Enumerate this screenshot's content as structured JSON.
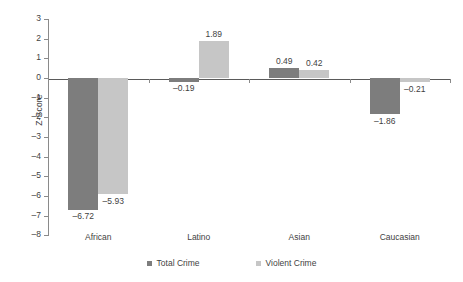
{
  "chart_data": {
    "type": "bar",
    "title": "",
    "xlabel": "",
    "ylabel": "Z-Score",
    "ylim": [
      -8,
      3
    ],
    "ytick_labels": [
      "3",
      "2",
      "1",
      "0",
      "–1",
      "–2",
      "–3",
      "–4",
      "–5",
      "–6",
      "–7",
      "–8"
    ],
    "yticks": [
      3,
      2,
      1,
      0,
      -1,
      -2,
      -3,
      -4,
      -5,
      -6,
      -7,
      -8
    ],
    "grid": false,
    "legend_position": "bottom-center",
    "categories": [
      "African",
      "Latino",
      "Asian",
      "Caucasian"
    ],
    "series": [
      {
        "name": "Total Crime",
        "color": "#7d7d7d",
        "values": [
          -6.72,
          -0.19,
          0.49,
          -1.86
        ],
        "labels": [
          "–6.72",
          "–0.19",
          "0.49",
          "–1.86"
        ]
      },
      {
        "name": "Violent Crime",
        "color": "#c6c6c6",
        "values": [
          -5.93,
          1.89,
          0.42,
          -0.21
        ],
        "labels": [
          "–5.93",
          "1.89",
          "0.42",
          "–0.21"
        ]
      }
    ]
  },
  "legend": {
    "items": [
      {
        "label": "Total Crime",
        "swatch": "total"
      },
      {
        "label": "Violent Crime",
        "swatch": "violent"
      }
    ]
  }
}
